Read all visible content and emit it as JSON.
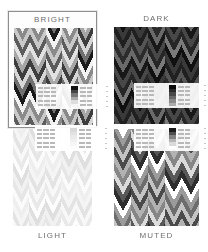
{
  "app": {
    "name": "palette-picker",
    "background": "#ffffff",
    "grayscale": true
  },
  "selection": {
    "selected_palette": "BRIGHT",
    "border_color": "#8e8e8e"
  },
  "palettes": [
    {
      "id": "bright",
      "label": "BRIGHT",
      "label_position": "top",
      "selected": true,
      "swatches": [
        "#1a1a1a",
        "#f2f2f2",
        "#8a8a8a",
        "#c9c9c9",
        "#5c5c5c",
        "#e2e2e2",
        "#a6a6a6",
        "#3d3d3d",
        "#d6d6d6",
        "#707070"
      ],
      "legend": {
        "rows": 5,
        "cols": 5,
        "values": [
          [
            "0.81",
            "0.90",
            "0.73",
            "0.61",
            "0.55"
          ],
          [
            "0.64",
            "0.88",
            "0.71",
            "0.52",
            "0.49"
          ],
          [
            "0.58",
            "0.82",
            "0.67",
            "0.45",
            "0.43"
          ],
          [
            "0.46",
            "0.79",
            "0.60",
            "0.39",
            "0.37"
          ],
          [
            "0.35",
            "0.70",
            "0.54",
            "0.31",
            "0.29"
          ]
        ],
        "ramp": [
          "#111111",
          "#444444",
          "#777777",
          "#aaaaaa",
          "#dddddd",
          "#f5f5f5"
        ]
      }
    },
    {
      "id": "dark",
      "label": "DARK",
      "label_position": "top",
      "selected": false,
      "swatches": [
        "#101010",
        "#3a3a3a",
        "#202020",
        "#555555",
        "#2c2c2c",
        "#6a6a6a",
        "#181818",
        "#484848",
        "#262626",
        "#7a7a7a"
      ],
      "legend": {
        "rows": 5,
        "cols": 5,
        "values": [
          [
            "0.22",
            "0.31",
            "0.18",
            "0.27",
            "0.14"
          ],
          [
            "0.25",
            "0.34",
            "0.21",
            "0.29",
            "0.17"
          ],
          [
            "0.19",
            "0.28",
            "0.16",
            "0.24",
            "0.12"
          ],
          [
            "0.23",
            "0.33",
            "0.20",
            "0.26",
            "0.15"
          ],
          [
            "0.17",
            "0.26",
            "0.13",
            "0.22",
            "0.11"
          ]
        ],
        "ramp": [
          "#0a0a0a",
          "#2a2a2a",
          "#4a4a4a",
          "#6a6a6a",
          "#8a8a8a",
          "#ababab"
        ]
      }
    },
    {
      "id": "light",
      "label": "LIGHT",
      "label_position": "bottom",
      "selected": false,
      "swatches": [
        "#fbfbfb",
        "#eeeeee",
        "#f5f5f5",
        "#e3e3e3",
        "#f8f8f8",
        "#e9e9e9",
        "#fdfdfd",
        "#dfdfdf",
        "#f1f1f1",
        "#e6e6e6"
      ],
      "legend": {
        "rows": 5,
        "cols": 5,
        "values": [
          [
            "0.94",
            "0.97",
            "0.91",
            "0.96",
            "0.89"
          ],
          [
            "0.93",
            "0.98",
            "0.90",
            "0.95",
            "0.88"
          ],
          [
            "0.92",
            "0.96",
            "0.89",
            "0.94",
            "0.87"
          ],
          [
            "0.91",
            "0.95",
            "0.88",
            "0.93",
            "0.86"
          ],
          [
            "0.90",
            "0.94",
            "0.87",
            "0.92",
            "0.85"
          ]
        ],
        "ramp": [
          "#d9d9d9",
          "#e2e2e2",
          "#eaeaea",
          "#f0f0f0",
          "#f6f6f6",
          "#fcfcfc"
        ]
      }
    },
    {
      "id": "muted",
      "label": "MUTED",
      "label_position": "bottom",
      "selected": false,
      "swatches": [
        "#2e2e2e",
        "#ffffff",
        "#9b9b9b",
        "#6d6d6d",
        "#c4c4c4",
        "#4a4a4a",
        "#b2b2b2",
        "#868686",
        "#dcdcdc",
        "#585858"
      ],
      "legend": {
        "rows": 5,
        "cols": 5,
        "values": [
          [
            "0.54",
            "0.68",
            "0.47",
            "0.72",
            "0.41"
          ],
          [
            "0.51",
            "0.65",
            "0.44",
            "0.69",
            "0.38"
          ],
          [
            "0.58",
            "0.71",
            "0.50",
            "0.75",
            "0.45"
          ],
          [
            "0.49",
            "0.62",
            "0.42",
            "0.66",
            "0.36"
          ],
          [
            "0.56",
            "0.69",
            "0.48",
            "0.73",
            "0.43"
          ]
        ],
        "ramp": [
          "#1c1c1c",
          "#4f4f4f",
          "#828282",
          "#b5b5b5",
          "#dadada",
          "#ffffff"
        ]
      }
    }
  ],
  "pattern": {
    "type": "chevron-bands",
    "columns": 5,
    "band_rows": 12
  }
}
